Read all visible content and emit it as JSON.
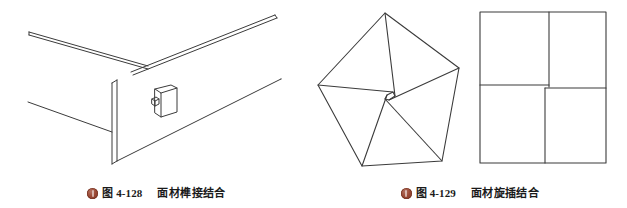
{
  "page": {
    "background_color": "#ffffff",
    "line_color": "#3b3b3b",
    "badge_color": "#9c4a36",
    "width": 627,
    "height": 208
  },
  "figures": [
    {
      "id": "figure-4-128",
      "badge_icon": "book-badge-icon",
      "number": "图 4-128",
      "title": "面材榫接结合",
      "illustration_name": "panel-tenon-joint-isometric-drawing",
      "description_parts": [
        "horizontal-rail-left",
        "horizontal-rail-right",
        "vertical-edge-board",
        "tenon-block-with-peg"
      ]
    },
    {
      "id": "figure-4-129",
      "badge_icon": "book-badge-icon",
      "number": "图 4-129",
      "title": "面材旋插结合",
      "illustration_name": "panel-pinwheel-joint-diagram",
      "description_parts": [
        "pentagon-pinwheel",
        "square-pinwheel"
      ]
    }
  ]
}
